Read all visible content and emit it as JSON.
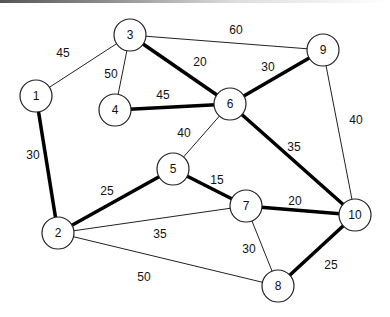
{
  "graph": {
    "nodes": [
      {
        "id": "1",
        "label": "1",
        "x": 36,
        "y": 96
      },
      {
        "id": "2",
        "label": "2",
        "x": 58,
        "y": 233
      },
      {
        "id": "3",
        "label": "3",
        "x": 130,
        "y": 35
      },
      {
        "id": "4",
        "label": "4",
        "x": 115,
        "y": 110
      },
      {
        "id": "5",
        "label": "5",
        "x": 173,
        "y": 169
      },
      {
        "id": "6",
        "label": "6",
        "x": 230,
        "y": 104
      },
      {
        "id": "7",
        "label": "7",
        "x": 246,
        "y": 206
      },
      {
        "id": "8",
        "label": "8",
        "x": 278,
        "y": 286
      },
      {
        "id": "9",
        "label": "9",
        "x": 323,
        "y": 50
      },
      {
        "id": "10",
        "label": "10",
        "x": 355,
        "y": 215
      }
    ],
    "edges": [
      {
        "from": "1",
        "to": "3",
        "weight": "45",
        "bold": false,
        "lx": 63,
        "ly": 53
      },
      {
        "from": "1",
        "to": "2",
        "weight": "30",
        "bold": true,
        "lx": 33,
        "ly": 155
      },
      {
        "from": "3",
        "to": "4",
        "weight": "50",
        "bold": false,
        "lx": 111,
        "ly": 74
      },
      {
        "from": "3",
        "to": "9",
        "weight": "60",
        "bold": false,
        "lx": 236,
        "ly": 30
      },
      {
        "from": "3",
        "to": "6",
        "weight": "20",
        "bold": true,
        "lx": 200,
        "ly": 62
      },
      {
        "from": "4",
        "to": "6",
        "weight": "45",
        "bold": true,
        "lx": 163,
        "ly": 95
      },
      {
        "from": "6",
        "to": "9",
        "weight": "30",
        "bold": true,
        "lx": 268,
        "ly": 67
      },
      {
        "from": "6",
        "to": "5",
        "weight": "40",
        "bold": false,
        "lx": 184,
        "ly": 133
      },
      {
        "from": "6",
        "to": "10",
        "weight": "35",
        "bold": true,
        "lx": 294,
        "ly": 147
      },
      {
        "from": "9",
        "to": "10",
        "weight": "40",
        "bold": false,
        "lx": 356,
        "ly": 120
      },
      {
        "from": "5",
        "to": "2",
        "weight": "25",
        "bold": true,
        "lx": 107,
        "ly": 191
      },
      {
        "from": "5",
        "to": "7",
        "weight": "15",
        "bold": true,
        "lx": 217,
        "ly": 180
      },
      {
        "from": "2",
        "to": "7",
        "weight": "35",
        "bold": false,
        "lx": 160,
        "ly": 234
      },
      {
        "from": "2",
        "to": "8",
        "weight": "50",
        "bold": false,
        "lx": 144,
        "ly": 277
      },
      {
        "from": "7",
        "to": "10",
        "weight": "20",
        "bold": true,
        "lx": 295,
        "ly": 201
      },
      {
        "from": "7",
        "to": "8",
        "weight": "30",
        "bold": false,
        "lx": 249,
        "ly": 249
      },
      {
        "from": "8",
        "to": "10",
        "weight": "25",
        "bold": true,
        "lx": 331,
        "ly": 265
      }
    ],
    "node_radius": 16
  }
}
